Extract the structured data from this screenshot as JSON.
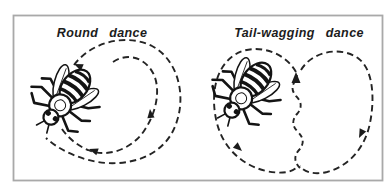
{
  "figure": {
    "panels": [
      {
        "title": "Round dance"
      },
      {
        "title": "Tail-wagging dance"
      }
    ],
    "colors": {
      "ink": "#1c1c1c",
      "frame": "#a9a9a9",
      "background": "#ffffff"
    }
  }
}
